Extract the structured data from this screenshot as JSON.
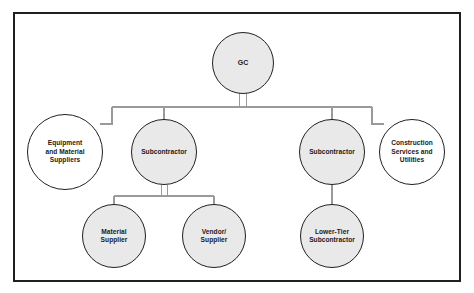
{
  "diagram": {
    "type": "organization-chart",
    "frame": {
      "border_color": "#231f20"
    },
    "palette": {
      "node_fill_gray": "#e9e9e9",
      "node_fill_white": "#ffffff",
      "node_stroke": "#231f20",
      "connector": "#9a9a9a",
      "text": "#1a1a1a"
    },
    "levels": [
      {
        "level": 1,
        "node_ids": [
          "gc"
        ]
      },
      {
        "level": 2,
        "node_ids": [
          "equipment-material-suppliers",
          "subcontractor-left",
          "subcontractor-right",
          "construction-services-utilities"
        ]
      },
      {
        "level": 3,
        "node_ids": [
          "material-supplier",
          "vendor-supplier",
          "lower-tier-subcontractor"
        ]
      }
    ],
    "nodes": [
      {
        "id": "gc",
        "label": "GC",
        "fill": "gray",
        "level": 1,
        "cx": 243,
        "cy": 63,
        "r": 31
      },
      {
        "id": "equipment-material-suppliers",
        "label": "Equipment\nand Material\nSuppliers",
        "fill": "white",
        "level": 2,
        "cx": 65,
        "cy": 152,
        "r": 38
      },
      {
        "id": "subcontractor-left",
        "label": "Subcontractor",
        "fill": "gray",
        "level": 2,
        "cx": 164,
        "cy": 152,
        "r": 33
      },
      {
        "id": "subcontractor-right",
        "label": "Subcontractor",
        "fill": "gray",
        "level": 2,
        "cx": 332,
        "cy": 152,
        "r": 33
      },
      {
        "id": "construction-services-utilities",
        "label": "Construction\nServices and\nUtilities",
        "fill": "white",
        "level": 2,
        "cx": 412,
        "cy": 152,
        "r": 33
      },
      {
        "id": "material-supplier",
        "label": "Material\nSupplier",
        "fill": "gray",
        "level": 3,
        "cx": 114,
        "cy": 236,
        "r": 32
      },
      {
        "id": "vendor-supplier",
        "label": "Vendor/\nSupplier",
        "fill": "gray",
        "level": 3,
        "cx": 214,
        "cy": 236,
        "r": 32
      },
      {
        "id": "lower-tier-subcontractor",
        "label": "Lower-Tier\nSubcontractor",
        "fill": "gray",
        "level": 3,
        "cx": 332,
        "cy": 236,
        "r": 32
      }
    ],
    "edges": [
      {
        "from": "gc",
        "to": "subcontractor-left",
        "style": "bus"
      },
      {
        "from": "gc",
        "to": "subcontractor-right",
        "style": "bus"
      },
      {
        "from": "gc",
        "to": "equipment-material-suppliers",
        "style": "stepped"
      },
      {
        "from": "gc",
        "to": "construction-services-utilities",
        "style": "stepped"
      },
      {
        "from": "subcontractor-left",
        "to": "material-supplier",
        "style": "bus"
      },
      {
        "from": "subcontractor-left",
        "to": "vendor-supplier",
        "style": "bus"
      },
      {
        "from": "subcontractor-right",
        "to": "lower-tier-subcontractor",
        "style": "straight"
      }
    ]
  }
}
